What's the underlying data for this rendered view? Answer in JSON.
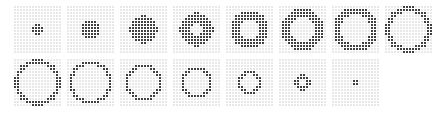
{
  "figure": {
    "type": "pixel-frame-sequence",
    "grid_columns": 8,
    "grid_rows": 2,
    "frame_pixel_resolution": 16,
    "frame_count": 15,
    "colors": {
      "page_background": "#ffffff",
      "pixel_off": "#e8e8e8",
      "pixel_on": "#3f3f3f",
      "pixel_gridline": "#ffffff"
    }
  },
  "chart_data": {
    "type": "heatmap",
    "title": "",
    "xlabel": "",
    "ylabel": "",
    "legend": [],
    "frames": [
      {
        "index": 1,
        "label": "frame-1",
        "shape": "filled-disc",
        "outer_radius": 1.8,
        "inner_radius": 0.0
      },
      {
        "index": 2,
        "label": "frame-2",
        "shape": "filled-disc",
        "outer_radius": 3.3,
        "inner_radius": 0.0
      },
      {
        "index": 3,
        "label": "frame-3",
        "shape": "filled-disc",
        "outer_radius": 4.6,
        "inner_radius": 0.0
      },
      {
        "index": 4,
        "label": "frame-4",
        "shape": "annulus",
        "outer_radius": 5.6,
        "inner_radius": 2.0
      },
      {
        "index": 5,
        "label": "frame-5",
        "shape": "annulus",
        "outer_radius": 6.4,
        "inner_radius": 3.1
      },
      {
        "index": 6,
        "label": "frame-6",
        "shape": "annulus",
        "outer_radius": 7.0,
        "inner_radius": 4.1
      },
      {
        "index": 7,
        "label": "frame-7",
        "shape": "annulus",
        "outer_radius": 7.5,
        "inner_radius": 5.0
      },
      {
        "index": 8,
        "label": "frame-8",
        "shape": "annulus",
        "outer_radius": 7.9,
        "inner_radius": 5.8
      },
      {
        "index": 9,
        "label": "frame-9",
        "shape": "annulus",
        "outer_radius": 7.9,
        "inner_radius": 6.2
      },
      {
        "index": 10,
        "label": "frame-10",
        "shape": "annulus",
        "outer_radius": 7.3,
        "inner_radius": 5.8
      },
      {
        "index": 11,
        "label": "frame-11",
        "shape": "annulus",
        "outer_radius": 6.3,
        "inner_radius": 4.9
      },
      {
        "index": 12,
        "label": "frame-12",
        "shape": "annulus",
        "outer_radius": 5.3,
        "inner_radius": 4.0
      },
      {
        "index": 13,
        "label": "frame-13",
        "shape": "annulus",
        "outer_radius": 4.2,
        "inner_radius": 2.9
      },
      {
        "index": 14,
        "label": "frame-14",
        "shape": "annulus",
        "outer_radius": 2.6,
        "inner_radius": 1.4
      },
      {
        "index": 15,
        "label": "frame-15",
        "shape": "filled-disc",
        "outer_radius": 1.0,
        "inner_radius": 0.0
      },
      {
        "index": 16,
        "label": "empty-slot",
        "shape": "empty",
        "outer_radius": 0.0,
        "inner_radius": 0.0
      }
    ]
  }
}
